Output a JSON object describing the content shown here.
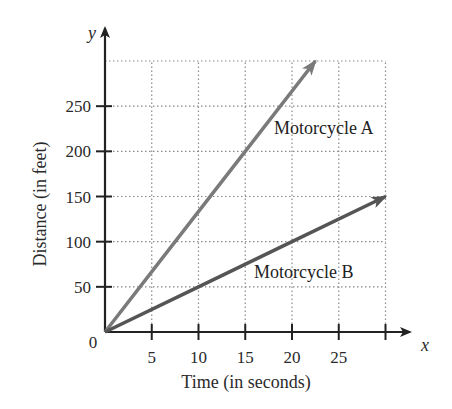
{
  "chart_data": {
    "type": "line",
    "title": "",
    "xlabel": "Time (in seconds)",
    "ylabel": "Distance (in feet)",
    "x_axis_var": "x",
    "y_axis_var": "y",
    "origin_label": "0",
    "xlim": [
      0,
      30
    ],
    "ylim": [
      0,
      300
    ],
    "x_ticks": [
      5,
      10,
      15,
      20,
      25,
      30
    ],
    "x_tick_labels": [
      "5",
      "10",
      "15",
      "20",
      "25",
      ""
    ],
    "y_ticks": [
      50,
      100,
      150,
      200,
      250,
      300
    ],
    "y_tick_labels": [
      "50",
      "100",
      "150",
      "200",
      "250",
      ""
    ],
    "grid": true,
    "grid_style": "dotted",
    "legend": "inline labels",
    "series": [
      {
        "name": "Motorcycle A",
        "color": "#7a7a7a",
        "x": [
          0,
          7.5,
          15,
          22.5
        ],
        "y": [
          0,
          100,
          200,
          300
        ],
        "arrow_end": true
      },
      {
        "name": "Motorcycle B",
        "color": "#555555",
        "x": [
          0,
          10,
          20,
          30
        ],
        "y": [
          0,
          50,
          100,
          150
        ],
        "arrow_end": true
      }
    ]
  },
  "layout": {
    "origin_px": [
      105,
      332
    ],
    "px_per_x": 9.35,
    "px_per_y": 0.9033,
    "grid_color": "#8a8a8a",
    "axis_color": "#222222"
  }
}
